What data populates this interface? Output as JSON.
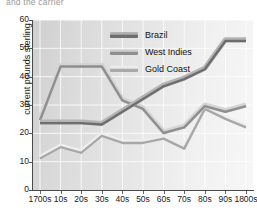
{
  "caption_fragment": "and the carrier",
  "chart_data": {
    "type": "line",
    "title": "",
    "xlabel": "",
    "ylabel": "current pounds sterling",
    "categories": [
      "1700s",
      "10s",
      "20s",
      "30s",
      "40s",
      "50s",
      "60s",
      "70s",
      "80s",
      "90s",
      "1800s"
    ],
    "ylim": [
      0,
      60
    ],
    "yticks": [
      0,
      10,
      20,
      30,
      40,
      50,
      60
    ],
    "grid": true,
    "legend_position": "top-center",
    "series": [
      {
        "name": "Brazil",
        "color": "#6e6e6e",
        "values": [
          24.0,
          24.0,
          24.0,
          23.5,
          28.0,
          32.5,
          37.0,
          39.5,
          43.0,
          53.0,
          53.0
        ]
      },
      {
        "name": "West Indies",
        "color": "#8f8f8f",
        "values": [
          25.0,
          44.0,
          44.0,
          44.0,
          32.0,
          29.0,
          20.5,
          22.5,
          30.0,
          28.0,
          30.0
        ]
      },
      {
        "name": "Gold Coast",
        "color": "#a8a8a8",
        "values": [
          11.5,
          15.5,
          13.5,
          19.5,
          17.0,
          17.0,
          18.5,
          15.0,
          29.0,
          25.5,
          22.5
        ]
      }
    ]
  },
  "legend": {
    "items": [
      {
        "label": "Brazil",
        "swatch": "#6e6e6e"
      },
      {
        "label": "West Indies",
        "swatch": "#909090"
      },
      {
        "label": "Gold Coast",
        "swatch": "#a9a9a9"
      }
    ]
  }
}
